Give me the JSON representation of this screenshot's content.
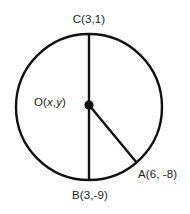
{
  "figure": {
    "name": "circle-with-diameter-and-radius",
    "background_color": "#ffffff",
    "stroke_color": "#111111",
    "labels": {
      "top_point": "C(3,1)",
      "bottom_point": "B(3,-9)",
      "center_point_prefix": "O(",
      "center_var_x": "x",
      "center_comma": ",",
      "center_var_y": "y",
      "center_point_suffix": ")",
      "circle_point": "A(6, -8)"
    },
    "geometry": {
      "circle_center_x": 89,
      "circle_center_y": 107,
      "circle_radius": 73,
      "center_dot_radius": 4.6,
      "diameter_top_x": 89,
      "diameter_top_y": 34,
      "diameter_bottom_x": 89,
      "diameter_bottom_y": 180,
      "radius_start_x": 89,
      "radius_start_y": 105,
      "radius_end_x": 137,
      "radius_end_y": 163,
      "circle_stroke_width": 2.4,
      "line_stroke_width": 2.4
    }
  }
}
